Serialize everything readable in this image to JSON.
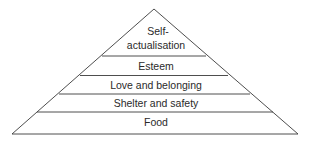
{
  "diagram": {
    "type": "pyramid",
    "title": "",
    "line_color": "#3a3a3a",
    "background": "#ffffff",
    "levels": [
      {
        "label_line1": "Self-",
        "label_line2": "actualisation",
        "position": "top"
      },
      {
        "label": "Esteem"
      },
      {
        "label": "Love and belonging"
      },
      {
        "label": "Shelter and safety"
      },
      {
        "label": "Food",
        "position": "base"
      }
    ]
  }
}
